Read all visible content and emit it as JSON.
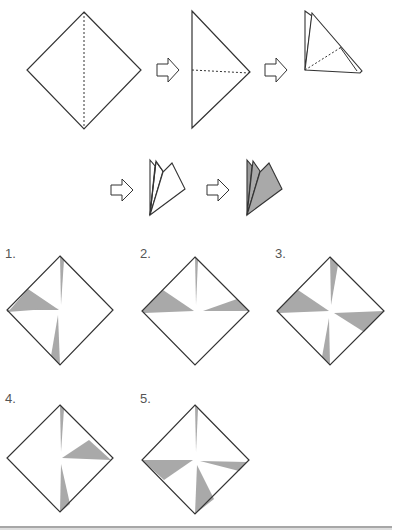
{
  "colors": {
    "stroke": "#333333",
    "shade": "#a9a9a9",
    "arrow_fill": "#ffffff",
    "label": "#555555",
    "rule": "#8a8a8a"
  },
  "sequence": {
    "steps": [
      {
        "id": "step-1",
        "description": "square paper with dashed vertical fold line"
      },
      {
        "id": "step-2",
        "description": "half folded triangle with dashed horizontal fold line"
      },
      {
        "id": "step-3",
        "description": "folded quarter triangle with dashed fold line"
      },
      {
        "id": "step-4",
        "description": "fanned folded layers"
      },
      {
        "id": "step-5",
        "description": "fanned folded layers shaded (cut)"
      }
    ],
    "arrow_glyph": "right-arrow-outline"
  },
  "options": [
    {
      "label": "1.",
      "shaded_wedges": [
        "top-narrow",
        "left-upper-wide",
        "bottom-left-narrow"
      ]
    },
    {
      "label": "2.",
      "shaded_wedges": [
        "top-narrow",
        "left-upper-wide",
        "right-upper-narrow"
      ]
    },
    {
      "label": "3.",
      "shaded_wedges": [
        "top-right-narrow",
        "left-upper-wide",
        "right-lower-wide",
        "bottom-left-narrow"
      ]
    },
    {
      "label": "4.",
      "shaded_wedges": [
        "top-narrow",
        "right-upper-wide",
        "bottom-right-narrow"
      ]
    },
    {
      "label": "5.",
      "shaded_wedges": [
        "top-narrow",
        "left-lower-wide",
        "right-lower-narrow",
        "bottom-right-wide"
      ]
    }
  ]
}
